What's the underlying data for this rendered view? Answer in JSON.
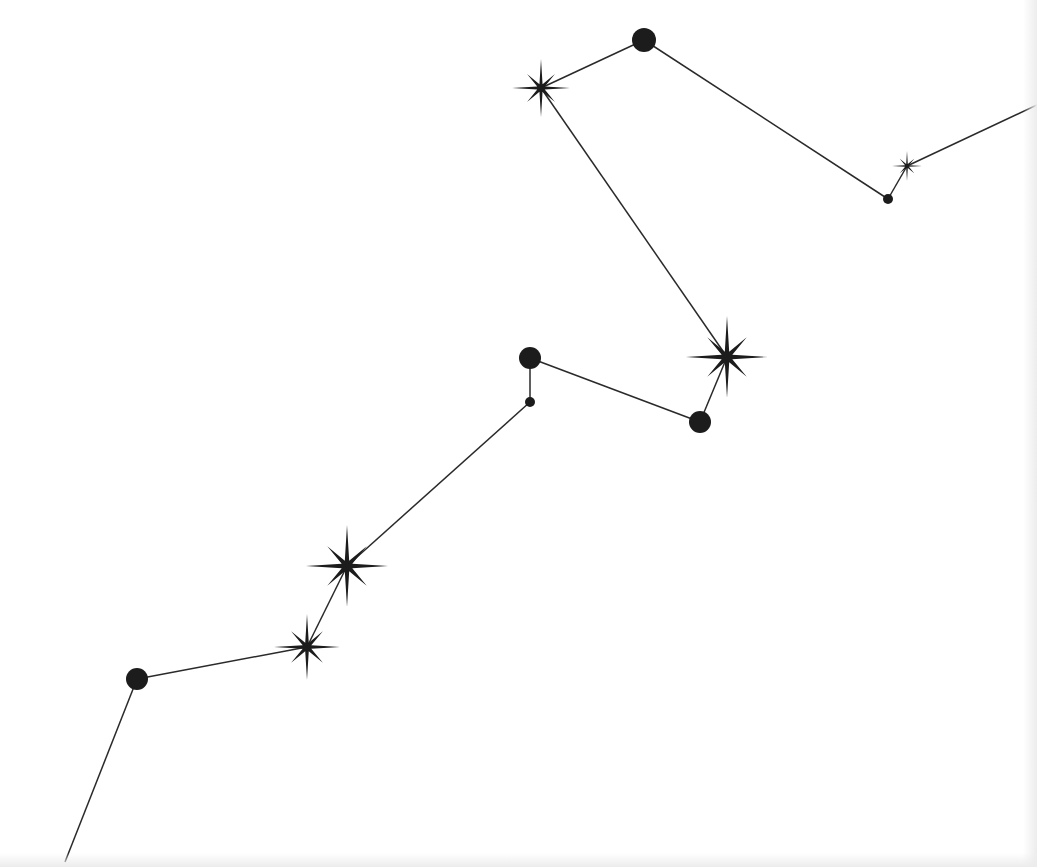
{
  "diagram": {
    "type": "constellation",
    "colors": {
      "background": "#ffffff",
      "ink": "#1c1c1c",
      "line": "#2a2a2a"
    },
    "path": [
      {
        "id": "start",
        "kind": "endpoint",
        "x": 65,
        "y": 862
      },
      {
        "id": "n1",
        "kind": "circle",
        "x": 137,
        "y": 679,
        "size": 11
      },
      {
        "id": "n2",
        "kind": "star",
        "x": 307,
        "y": 647,
        "size": 33
      },
      {
        "id": "n3",
        "kind": "star",
        "x": 347,
        "y": 566,
        "size": 41
      },
      {
        "id": "n4",
        "kind": "dot",
        "x": 530,
        "y": 402,
        "size": 5
      },
      {
        "id": "n5",
        "kind": "circle",
        "x": 530,
        "y": 358,
        "size": 11
      },
      {
        "id": "n6",
        "kind": "circle",
        "x": 700,
        "y": 422,
        "size": 11
      },
      {
        "id": "n7",
        "kind": "star",
        "x": 727,
        "y": 357,
        "size": 41
      },
      {
        "id": "n8",
        "kind": "star",
        "x": 541,
        "y": 88,
        "size": 29
      },
      {
        "id": "n9",
        "kind": "circle",
        "x": 644,
        "y": 40,
        "size": 12
      },
      {
        "id": "n10",
        "kind": "dot",
        "x": 888,
        "y": 199,
        "size": 5
      },
      {
        "id": "n11",
        "kind": "star",
        "x": 907,
        "y": 166,
        "size": 15
      },
      {
        "id": "end",
        "kind": "endpoint",
        "x": 1037,
        "y": 105
      }
    ]
  }
}
